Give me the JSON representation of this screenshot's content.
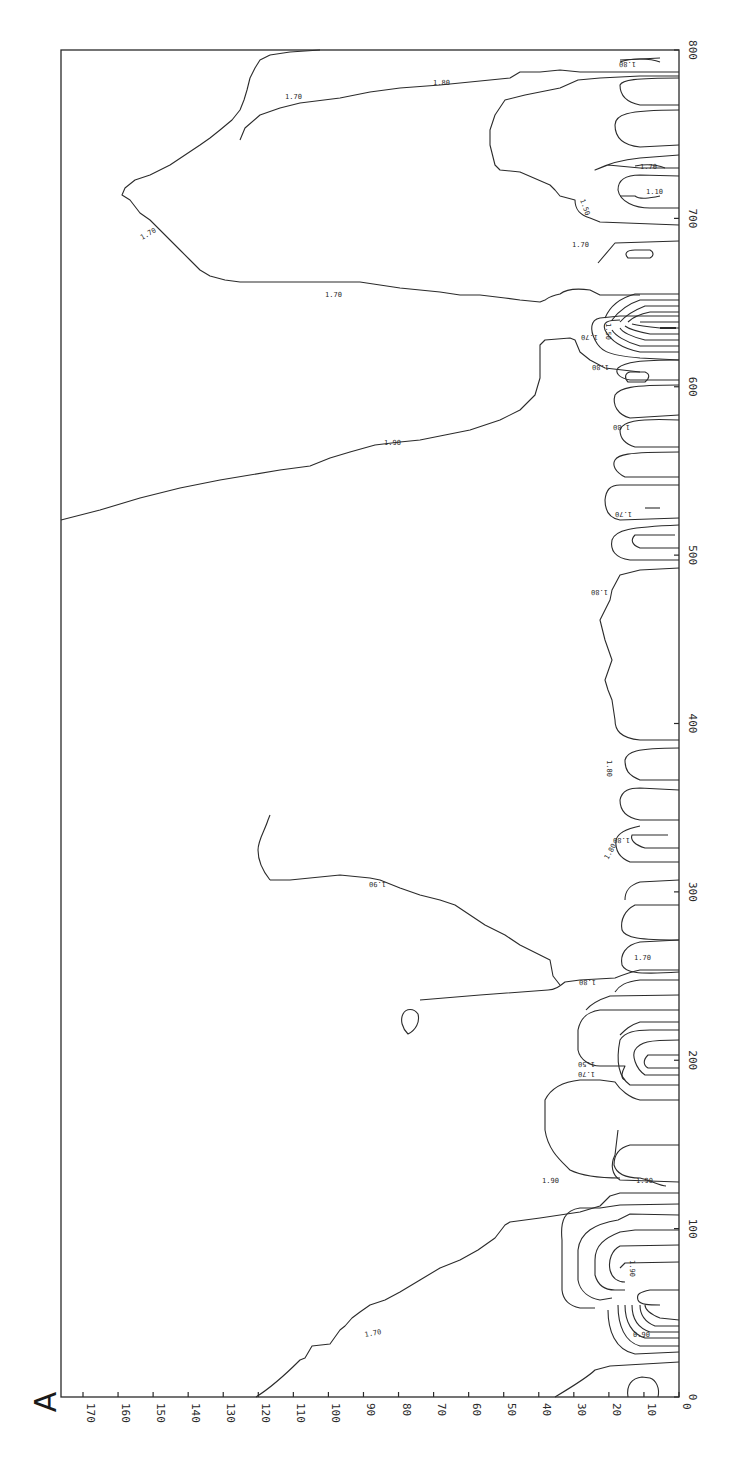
{
  "panel_label": "A",
  "chart_data": {
    "type": "heatmap",
    "subtype": "contour",
    "title": "",
    "panel_label": "A",
    "orientation": "rotated 90 degrees (x-axis vertical on right edge, y-axis horizontal along bottom)",
    "xlabel": "",
    "ylabel": "",
    "x_axis": {
      "range": [
        0,
        800
      ],
      "ticks": [
        0,
        100,
        200,
        300,
        400,
        500,
        600,
        700,
        800
      ],
      "tick_labels": [
        "0",
        "100",
        "200",
        "300",
        "400",
        "500",
        "600",
        "700",
        "800"
      ]
    },
    "y_axis": {
      "range": [
        0,
        175
      ],
      "ticks": [
        0,
        10,
        20,
        30,
        40,
        50,
        60,
        70,
        80,
        90,
        100,
        110,
        120,
        130,
        140,
        150,
        160,
        170
      ],
      "tick_labels": [
        "0",
        "10",
        "20",
        "30",
        "40",
        "50",
        "60",
        "70",
        "80",
        "90",
        "100",
        "110",
        "120",
        "130",
        "140",
        "150",
        "160",
        "170"
      ]
    },
    "contour_levels": [
      "0.90",
      "1.10",
      "1.50",
      "1.70",
      "1.80",
      "1.90"
    ],
    "grid": false,
    "legend": null,
    "annotations": [
      {
        "label": "1.70",
        "x": 30,
        "y": 85,
        "note": "broad contour rising from y=120 at x=0 to y~75 at x~80"
      },
      {
        "label": "0.90",
        "x": 25,
        "y": 10
      },
      {
        "label": "1.90",
        "x": 95,
        "y": 15
      },
      {
        "label": "1.90",
        "x": 125,
        "y": 55
      },
      {
        "label": "1.50",
        "x": 150,
        "y": 27
      },
      {
        "label": "1.70",
        "x": 145,
        "y": 27
      },
      {
        "label": "1.80",
        "x": 195,
        "y": 27
      },
      {
        "label": "1.90",
        "x": 255,
        "y": 95
      },
      {
        "label": "1.80",
        "x": 240,
        "y": 25
      },
      {
        "label": "1.70",
        "x": 265,
        "y": 15
      },
      {
        "label": "1.80",
        "x": 290,
        "y": 15
      },
      {
        "label": "1.80",
        "x": 330,
        "y": 25
      },
      {
        "label": "1.80",
        "x": 420,
        "y": 25
      },
      {
        "label": "1.70",
        "x": 435,
        "y": 15
      },
      {
        "label": "1.80",
        "x": 525,
        "y": 15
      },
      {
        "label": "1.90",
        "x": 555,
        "y": 85
      },
      {
        "label": "1.80",
        "x": 600,
        "y": 25
      },
      {
        "label": "1.70",
        "x": 620,
        "y": 25
      },
      {
        "label": "1.50",
        "x": 630,
        "y": 25
      },
      {
        "label": "1.70",
        "x": 655,
        "y": 100
      },
      {
        "label": "1.70",
        "x": 685,
        "y": 25
      },
      {
        "label": "1.70",
        "x": 710,
        "y": 160
      },
      {
        "label": "1.50",
        "x": 720,
        "y": 35
      },
      {
        "label": "1.10",
        "x": 720,
        "y": 8
      },
      {
        "label": "1.70",
        "x": 735,
        "y": 12
      },
      {
        "label": "1.70",
        "x": 785,
        "y": 95
      },
      {
        "label": "1.80",
        "x": 785,
        "y": 45
      },
      {
        "label": "1.80",
        "x": 795,
        "y": 12
      }
    ],
    "features": [
      {
        "description": "Dense nested low-value contours near y=0-40 at x~10-70 (minimum ~0.90)"
      },
      {
        "description": "Closed bowl contour near x~0-10, y~5-15"
      },
      {
        "description": "Nested low-value cluster near x~130-175, y=0-45 (1.50-1.70)"
      },
      {
        "description": "Small isolated closed contour near x~148, y~77"
      },
      {
        "description": "1.90 contour spanning x~200-255 rising to top (y>170)"
      },
      {
        "description": "Dense nested contours near x~610-660, y=0-35"
      },
      {
        "description": "1.90 contour spanning x~525-610 rising to top"
      },
      {
        "description": "Large 1.70 region x~650-790 reaching y~160"
      },
      {
        "description": "Finger-like contours perpendicular to x-axis at y<30 throughout"
      }
    ]
  }
}
